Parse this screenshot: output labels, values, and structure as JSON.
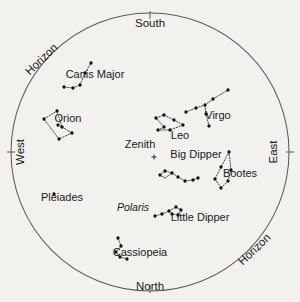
{
  "chart_data": {
    "type": "scatter",
    "title": "",
    "subtitle": "",
    "xlabel": "",
    "ylabel": "",
    "projection": "all-sky horizon circle",
    "grid": false,
    "legend_position": "none",
    "horizon_circle": {
      "cx": 150,
      "cy": 152,
      "r": 139
    },
    "compass_points": [
      {
        "id": "south",
        "label": "South",
        "x": 150,
        "y": 27,
        "rotation": 0,
        "tick": {
          "x1": 150,
          "y1": 11,
          "x2": 150,
          "y2": 19
        }
      },
      {
        "id": "north",
        "label": "North",
        "x": 150,
        "y": 290,
        "rotation": 0,
        "tick": {
          "x1": 150,
          "y1": 285,
          "x2": 150,
          "y2": 293
        }
      },
      {
        "id": "west",
        "label": "West",
        "x": 24,
        "y": 152,
        "rotation": -90,
        "tick": {
          "x1": 7,
          "y1": 152,
          "x2": 15,
          "y2": 152
        }
      },
      {
        "id": "east",
        "label": "East",
        "x": 277,
        "y": 152,
        "rotation": -90,
        "tick": {
          "x1": 286,
          "y1": 152,
          "x2": 294,
          "y2": 152
        }
      }
    ],
    "horizon_labels": [
      {
        "id": "horizon-upper-left",
        "label": "Horizon",
        "x": 44,
        "y": 62,
        "rotation": -44
      },
      {
        "id": "horizon-lower-right",
        "label": "Horizon",
        "x": 257,
        "y": 252,
        "rotation": -44
      }
    ],
    "zenith": {
      "label": "Zenith",
      "label_x": 140,
      "label_y": 148,
      "marker_x": 154,
      "marker_y": 157,
      "marker_size": 5
    },
    "constellations": [
      {
        "name": "Canis Major",
        "label_x": 95,
        "label_y": 78,
        "stars": [
          [
            64,
            87
          ],
          [
            73,
            88
          ],
          [
            80,
            85
          ],
          [
            85,
            73
          ],
          [
            91,
            63
          ]
        ],
        "lines": [
          [
            [
              64,
              87
            ],
            [
              73,
              88
            ]
          ],
          [
            [
              73,
              88
            ],
            [
              80,
              85
            ]
          ],
          [
            [
              80,
              85
            ],
            [
              85,
              73
            ]
          ],
          [
            [
              85,
              73
            ],
            [
              91,
              63
            ]
          ]
        ]
      },
      {
        "name": "Orion",
        "label_x": 68,
        "label_y": 122,
        "stars": [
          [
            44,
            119
          ],
          [
            57,
            111
          ],
          [
            58,
            125
          ],
          [
            62,
            127
          ],
          [
            72,
            133
          ],
          [
            59,
            139
          ]
        ],
        "lines": [
          [
            [
              44,
              119
            ],
            [
              57,
              111
            ]
          ],
          [
            [
              57,
              111
            ],
            [
              62,
              127
            ]
          ],
          [
            [
              62,
              127
            ],
            [
              72,
              133
            ]
          ],
          [
            [
              72,
              133
            ],
            [
              59,
              139
            ]
          ],
          [
            [
              59,
              139
            ],
            [
              44,
              119
            ]
          ],
          [
            [
              58,
              125
            ],
            [
              62,
              127
            ]
          ]
        ]
      },
      {
        "name": "Leo",
        "label_x": 180,
        "label_y": 139,
        "stars": [
          [
            156,
            118
          ],
          [
            164,
            115
          ],
          [
            174,
            120
          ],
          [
            183,
            125
          ],
          [
            164,
            127
          ],
          [
            158,
            130
          ],
          [
            170,
            130
          ]
        ],
        "lines": [
          [
            [
              156,
              118
            ],
            [
              164,
              115
            ]
          ],
          [
            [
              164,
              115
            ],
            [
              174,
              120
            ]
          ],
          [
            [
              174,
              120
            ],
            [
              183,
              125
            ]
          ],
          [
            [
              183,
              125
            ],
            [
              170,
              130
            ]
          ],
          [
            [
              170,
              130
            ],
            [
              158,
              130
            ]
          ],
          [
            [
              158,
              130
            ],
            [
              164,
              127
            ]
          ],
          [
            [
              164,
              127
            ],
            [
              156,
              118
            ]
          ]
        ]
      },
      {
        "name": "Virgo",
        "label_x": 218,
        "label_y": 119,
        "stars": [
          [
            186,
            112
          ],
          [
            196,
            108
          ],
          [
            205,
            105
          ],
          [
            213,
            99
          ],
          [
            228,
            90
          ],
          [
            206,
            114
          ],
          [
            209,
            126
          ]
        ],
        "lines": [
          [
            [
              186,
              112
            ],
            [
              196,
              108
            ]
          ],
          [
            [
              196,
              108
            ],
            [
              205,
              105
            ]
          ],
          [
            [
              205,
              105
            ],
            [
              213,
              99
            ]
          ],
          [
            [
              213,
              99
            ],
            [
              228,
              90
            ]
          ],
          [
            [
              205,
              105
            ],
            [
              206,
              114
            ]
          ],
          [
            [
              206,
              114
            ],
            [
              209,
              126
            ]
          ]
        ]
      },
      {
        "name": "Big Dipper",
        "label_x": 196,
        "label_y": 158,
        "stars": [
          [
            160,
            175
          ],
          [
            165,
            171
          ],
          [
            172,
            173
          ],
          [
            178,
            177
          ],
          [
            185,
            181
          ],
          [
            193,
            180
          ],
          [
            198,
            178
          ]
        ],
        "lines": [
          [
            [
              160,
              175
            ],
            [
              165,
              171
            ]
          ],
          [
            [
              165,
              171
            ],
            [
              172,
              173
            ]
          ],
          [
            [
              172,
              173
            ],
            [
              178,
              177
            ]
          ],
          [
            [
              178,
              177
            ],
            [
              185,
              181
            ]
          ],
          [
            [
              185,
              181
            ],
            [
              193,
              180
            ]
          ],
          [
            [
              193,
              180
            ],
            [
              198,
              178
            ]
          ],
          [
            [
              160,
              175
            ],
            [
              165,
              178
            ]
          ],
          [
            [
              165,
              178
            ],
            [
              172,
              173
            ]
          ]
        ]
      },
      {
        "name": "Bootes",
        "label_x": 240,
        "label_y": 177,
        "stars": [
          [
            229,
            152
          ],
          [
            221,
            167
          ],
          [
            215,
            179
          ],
          [
            221,
            188
          ],
          [
            228,
            181
          ],
          [
            231,
            170
          ]
        ],
        "lines": [
          [
            [
              229,
              152
            ],
            [
              221,
              167
            ]
          ],
          [
            [
              221,
              167
            ],
            [
              215,
              179
            ]
          ],
          [
            [
              215,
              179
            ],
            [
              221,
              188
            ]
          ],
          [
            [
              221,
              188
            ],
            [
              228,
              181
            ]
          ],
          [
            [
              228,
              181
            ],
            [
              231,
              170
            ]
          ],
          [
            [
              231,
              170
            ],
            [
              229,
              152
            ]
          ]
        ]
      },
      {
        "name": "Little Dipper",
        "label_x": 200,
        "label_y": 221,
        "stars": [
          [
            155,
            216
          ],
          [
            162,
            214
          ],
          [
            169,
            211
          ],
          [
            176,
            207
          ],
          [
            181,
            210
          ],
          [
            178,
            215
          ],
          [
            172,
            214
          ]
        ],
        "lines": [
          [
            [
              155,
              216
            ],
            [
              162,
              214
            ]
          ],
          [
            [
              162,
              214
            ],
            [
              169,
              211
            ]
          ],
          [
            [
              169,
              211
            ],
            [
              176,
              207
            ]
          ],
          [
            [
              176,
              207
            ],
            [
              181,
              210
            ]
          ],
          [
            [
              181,
              210
            ],
            [
              178,
              215
            ]
          ],
          [
            [
              178,
              215
            ],
            [
              172,
              214
            ]
          ],
          [
            [
              172,
              214
            ],
            [
              169,
              211
            ]
          ]
        ]
      },
      {
        "name": "Cassiopeia",
        "label_x": 140,
        "label_y": 256,
        "stars": [
          [
            118,
            238
          ],
          [
            121,
            246
          ],
          [
            116,
            252
          ],
          [
            120,
            257
          ],
          [
            127,
            259
          ]
        ],
        "lines": [
          [
            [
              118,
              238
            ],
            [
              121,
              246
            ]
          ],
          [
            [
              121,
              246
            ],
            [
              116,
              252
            ]
          ],
          [
            [
              116,
              252
            ],
            [
              120,
              257
            ]
          ],
          [
            [
              120,
              257
            ],
            [
              127,
              259
            ]
          ]
        ]
      },
      {
        "name": "Pleiades",
        "label_x": 62,
        "label_y": 201,
        "stars": [
          [
            54,
            194
          ]
        ],
        "lines": []
      }
    ],
    "named_stars": [
      {
        "name": "Polaris",
        "label_x": 133,
        "label_y": 211,
        "italic": true
      }
    ]
  }
}
